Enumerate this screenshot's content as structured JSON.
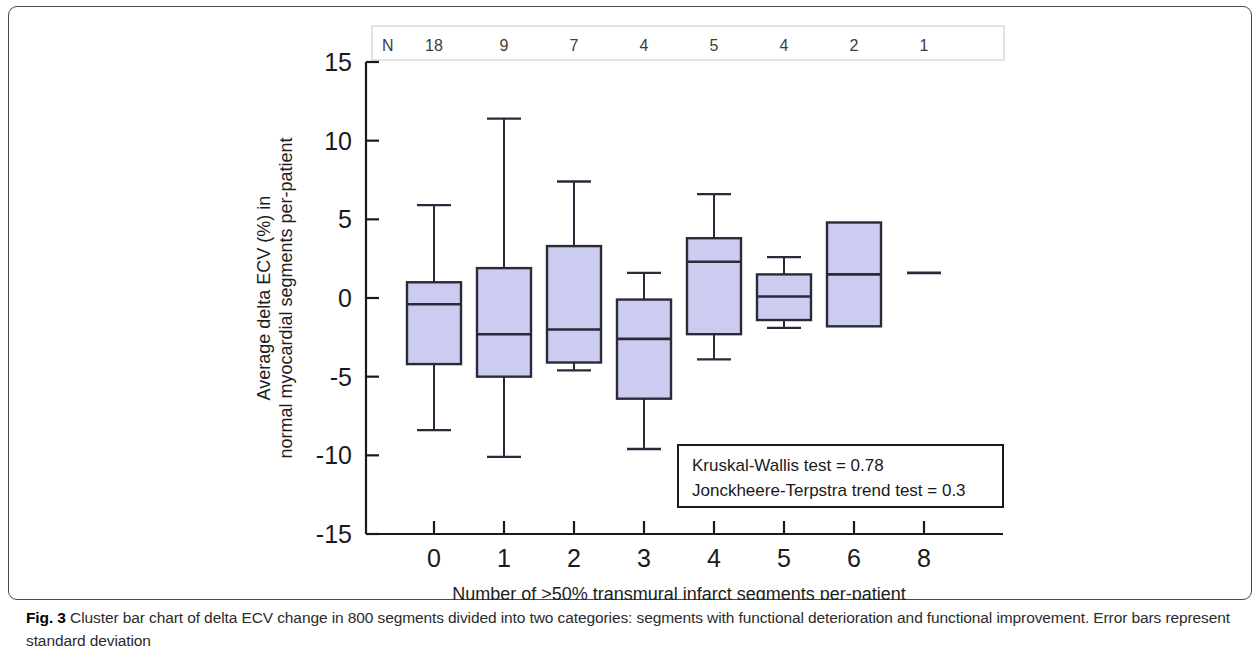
{
  "figure": {
    "caption_label": "Fig. 3",
    "caption_text": " Cluster bar chart of delta ECV change in 800 segments divided into two categories: segments with functional deterioration and functional improvement. Error bars represent standard deviation"
  },
  "annotations": {
    "n_row_label": "N",
    "stat_line_1": "Kruskal-Wallis test = 0.78",
    "stat_line_2": "Jonckheere-Terpstra trend test = 0.3"
  },
  "colors": {
    "box_fill": "#ccccf0",
    "box_stroke": "#2a2a3a",
    "axis": "#1a1a1a",
    "n_box_border": "#c8c8c8"
  },
  "chart_data": {
    "type": "box",
    "title": "",
    "xlabel": "Number of >50% transmural infarct segments per-patient",
    "ylabel": "Average delta ECV (%) in normal myocardial segments per-patient",
    "categories": [
      "0",
      "1",
      "2",
      "3",
      "4",
      "5",
      "6",
      "8"
    ],
    "n_counts": [
      18,
      9,
      7,
      4,
      5,
      4,
      2,
      1
    ],
    "ylim": [
      -15,
      15
    ],
    "yticks": [
      15,
      10,
      5,
      0,
      -5,
      -10,
      -15
    ],
    "ytick_labels": [
      "15",
      "10",
      "5",
      "0",
      "-5",
      "-10",
      "-15"
    ],
    "grid": false,
    "legend": "none",
    "boxes": [
      {
        "category": "0",
        "n": 18,
        "whisker_high": 5.9,
        "q3": 1.0,
        "median": -0.4,
        "q1": -4.2,
        "whisker_low": -8.4
      },
      {
        "category": "1",
        "n": 9,
        "whisker_high": 11.4,
        "q3": 1.9,
        "median": -2.3,
        "q1": -5.0,
        "whisker_low": -10.1
      },
      {
        "category": "2",
        "n": 7,
        "whisker_high": 7.4,
        "q3": 3.3,
        "median": -2.0,
        "q1": -4.1,
        "whisker_low": -4.6
      },
      {
        "category": "3",
        "n": 4,
        "whisker_high": 1.6,
        "q3": -0.1,
        "median": -2.6,
        "q1": -6.4,
        "whisker_low": -9.6
      },
      {
        "category": "4",
        "n": 5,
        "whisker_high": 6.6,
        "q3": 3.8,
        "median": 2.3,
        "q1": -2.3,
        "whisker_low": -3.9
      },
      {
        "category": "5",
        "n": 4,
        "whisker_high": 2.6,
        "q3": 1.5,
        "median": 0.1,
        "q1": -1.4,
        "whisker_low": -1.9
      },
      {
        "category": "6",
        "n": 2,
        "whisker_high": null,
        "q3": 4.8,
        "median": 1.5,
        "q1": -1.8,
        "whisker_low": null
      },
      {
        "category": "8",
        "n": 1,
        "whisker_high": null,
        "q3": null,
        "median": 1.6,
        "q1": null,
        "whisker_low": null
      }
    ],
    "statistics": {
      "kruskal_wallis": 0.78,
      "jonckheere_terpstra_trend": 0.3
    }
  }
}
